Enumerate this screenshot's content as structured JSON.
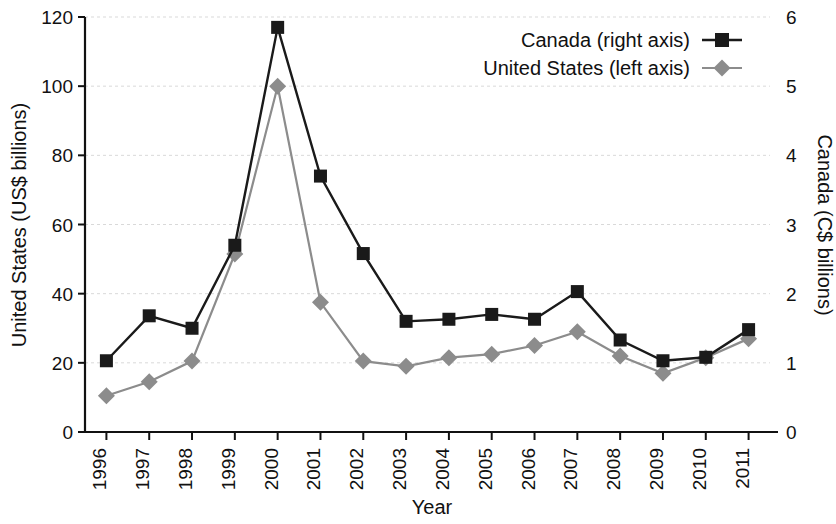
{
  "chart_data": {
    "type": "line",
    "title": "",
    "subtitle": "",
    "xlabel": "Year",
    "ylabel": "United States (US$ billions)",
    "y2label": "Canada (C$ billions)",
    "categories": [
      "1996",
      "1997",
      "1998",
      "1999",
      "2000",
      "2001",
      "2002",
      "2003",
      "2004",
      "2005",
      "2006",
      "2007",
      "2008",
      "2009",
      "2010",
      "2011"
    ],
    "ylim": [
      0,
      120
    ],
    "y2lim": [
      0,
      6
    ],
    "yticks": [
      0,
      20,
      40,
      60,
      80,
      100,
      120
    ],
    "y2ticks": [
      0,
      1,
      2,
      3,
      4,
      5,
      6
    ],
    "grid": true,
    "legend_position": "top-right",
    "series": [
      {
        "name": "Canada (right axis)",
        "axis": "right",
        "color": "#1a1a1a",
        "marker": "square",
        "values": [
          1.03,
          1.68,
          1.5,
          2.7,
          5.85,
          3.7,
          2.58,
          1.6,
          1.63,
          1.7,
          1.63,
          2.03,
          1.33,
          1.03,
          1.08,
          1.48
        ]
      },
      {
        "name": "United States (left axis)",
        "axis": "left",
        "color": "#8c8c8c",
        "marker": "diamond",
        "values": [
          10.5,
          14.5,
          20.5,
          51.5,
          100,
          37.5,
          20.5,
          19,
          21.5,
          22.5,
          25,
          29,
          22,
          17,
          21.5,
          27
        ]
      }
    ]
  },
  "legend": {
    "entries": [
      {
        "label": "Canada (right axis)"
      },
      {
        "label": "United States (left axis)"
      }
    ]
  },
  "axes": {
    "left_title": "United States (US$ billions)",
    "right_title": "Canada (C$ billions)",
    "x_title": "Year"
  }
}
